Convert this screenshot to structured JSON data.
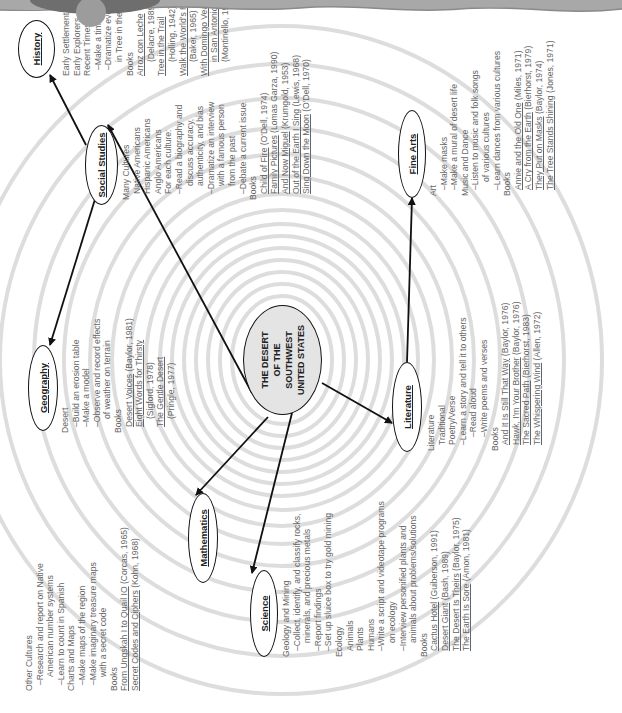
{
  "center": {
    "line1": "THE DESERT",
    "line2": "OF THE SOUTHWEST",
    "line3": "UNITED STATES"
  },
  "nodes": {
    "history": "History",
    "social_studies": "Social Studies",
    "geography": "Geography",
    "mathematics": "Mathematics",
    "science": "Science",
    "literature": "Literature",
    "fine_arts": "Fine Arts"
  },
  "blocks": {
    "other_cultures": [
      {
        "t": "Other Cultures",
        "i": 0,
        "u": false
      },
      {
        "t": "–Research and report on Native",
        "i": 1,
        "u": false
      },
      {
        "t": "American number systems",
        "i": 2,
        "u": false
      },
      {
        "t": "–Learn to count in Spanish",
        "i": 1,
        "u": false
      },
      {
        "t": "Charts and Maps",
        "i": 0,
        "u": false
      },
      {
        "t": "–Make maps of the region",
        "i": 1,
        "u": false
      },
      {
        "t": "–Make imaginary treasure maps",
        "i": 1,
        "u": false
      },
      {
        "t": "with a secret code",
        "i": 2,
        "u": false
      },
      {
        "t": "Books",
        "i": 0,
        "u": false
      },
      {
        "t": "From Ungskah I to Quail IO (Corcas, 1965)",
        "i": 0,
        "u": false
      },
      {
        "t": "Secret Codes and Ciphers (Kohn, 1968)",
        "i": 0,
        "u": false
      }
    ],
    "geography": [
      {
        "t": "Desert",
        "i": 0
      },
      {
        "t": "–Build an erosion table",
        "i": 1
      },
      {
        "t": "–Make a model",
        "i": 1
      },
      {
        "t": "–Observe and record effects",
        "i": 1
      },
      {
        "t": "of weather on terrain",
        "i": 2
      },
      {
        "t": "Books",
        "i": 0
      },
      {
        "t": "Desert Voices (Baylor, 1981)",
        "i": 1
      },
      {
        "t": "Eight Words for Thirsty",
        "i": 1
      },
      {
        "t": "(Sigford, 1978)",
        "i": 2
      },
      {
        "t": "The Gentle Desert",
        "i": 1
      },
      {
        "t": "(Pringle, 1977)",
        "i": 2
      }
    ],
    "social_studies": [
      {
        "t": "Many Cultures",
        "i": 0
      },
      {
        "t": "Native Americans",
        "i": 1
      },
      {
        "t": "Hispanic Americans",
        "i": 1
      },
      {
        "t": "Anglo Americans",
        "i": 1
      },
      {
        "t": "For each culture:",
        "i": 1
      },
      {
        "t": "–Read a biography and",
        "i": 1
      },
      {
        "t": "discuss accuracy,",
        "i": 2
      },
      {
        "t": "authenticity, and bias",
        "i": 2
      },
      {
        "t": "–Dramatize an interview",
        "i": 1
      },
      {
        "t": "with a famous person",
        "i": 2
      },
      {
        "t": "from the past",
        "i": 2
      },
      {
        "t": "–Debate a current issue",
        "i": 1
      },
      {
        "t": "Books",
        "i": 0
      },
      {
        "t": "Child of Fire (O'Dell, 1974)",
        "i": 1
      },
      {
        "t": "Family Pictures (Lomas Garza, 1990)",
        "i": 1
      },
      {
        "t": "And Now Miguel (Krumgold, 1953)",
        "i": 1
      },
      {
        "t": "Out of the Earth I Sing (Lewis, 1968)",
        "i": 1
      },
      {
        "t": "Sing Down the Moon (O'Dell, 1970)",
        "i": 1
      }
    ],
    "history": [
      {
        "t": "Early Settlement",
        "i": 0
      },
      {
        "t": "Early Explorers",
        "i": 0
      },
      {
        "t": "Recent Times",
        "i": 0
      },
      {
        "t": "–Make a timeline",
        "i": 1
      },
      {
        "t": "–Dramatize events",
        "i": 1
      },
      {
        "t": "in Tree in the Trail",
        "i": 2
      },
      {
        "t": "Books",
        "i": 0
      },
      {
        "t": "Arroz con Leche",
        "i": 0
      },
      {
        "t": "(Delacre, 1989)",
        "i": 2
      },
      {
        "t": "Tree in the Trail",
        "i": 0
      },
      {
        "t": "(Holling, 1942)",
        "i": 2
      },
      {
        "t": "Walk the World's Rim",
        "i": 0
      },
      {
        "t": "(Baker, 1965)",
        "i": 2
      },
      {
        "t": "With Domingo Veal",
        "i": 0
      },
      {
        "t": "in San Antonio",
        "i": 2
      },
      {
        "t": "(Montinello, 1980)",
        "i": 2
      }
    ],
    "science": [
      {
        "t": "Geology and Mining",
        "i": 0
      },
      {
        "t": "–Collect, identify, and classify rocks,",
        "i": 1
      },
      {
        "t": "minerals, and precious metals",
        "i": 2
      },
      {
        "t": "–Report findings",
        "i": 1
      },
      {
        "t": "–Set up sluice box to try gold mining",
        "i": 1
      },
      {
        "t": "Ecology",
        "i": 0
      },
      {
        "t": "Animals",
        "i": 1
      },
      {
        "t": "Plants",
        "i": 1
      },
      {
        "t": "Humans",
        "i": 1
      },
      {
        "t": "–Write a script and videotape programs",
        "i": 1
      },
      {
        "t": "on ecology",
        "i": 2
      },
      {
        "t": "–Interview personified plants and",
        "i": 1
      },
      {
        "t": "animals about problems/solutions",
        "i": 2
      },
      {
        "t": "Books",
        "i": 0
      },
      {
        "t": "Cactus Hotel (Guiberson, 1991)",
        "i": 1
      },
      {
        "t": "Desert Giant (Bash, 1989)",
        "i": 1
      },
      {
        "t": "The Desert Is Theirs (Baylor, 1975)",
        "i": 1
      },
      {
        "t": "The Earth Is Sore (Amon, 1981)",
        "i": 1
      }
    ],
    "literature": [
      {
        "t": "Literature",
        "i": 0
      },
      {
        "t": "Traditional",
        "i": 1
      },
      {
        "t": "Poetry/Verse",
        "i": 1
      },
      {
        "t": "–Learn a story and tell it to others",
        "i": 1
      },
      {
        "t": "–Read aloud",
        "i": 2
      },
      {
        "t": "–Write poems and verses",
        "i": 2
      },
      {
        "t": "Books",
        "i": 0
      },
      {
        "t": "And It Is Still That Way (Baylor, 1976)",
        "i": 1
      },
      {
        "t": "Hawk, I'm Your Brother (Baylor, 1976)",
        "i": 1
      },
      {
        "t": "The Sacred Path (Bierhorst, 1983)",
        "i": 1
      },
      {
        "t": "The Whispering Wind (Allen, 1972)",
        "i": 1
      }
    ],
    "fine_arts": [
      {
        "t": "Art",
        "i": 0
      },
      {
        "t": "–Make masks",
        "i": 1
      },
      {
        "t": "–Make a mural of desert life",
        "i": 1
      },
      {
        "t": "Music and Dance",
        "i": 0
      },
      {
        "t": "–Listen to music and folk songs",
        "i": 1
      },
      {
        "t": "of various cultures",
        "i": 2
      },
      {
        "t": "–Learn dances from various cultures",
        "i": 1
      },
      {
        "t": "Books",
        "i": 0
      },
      {
        "t": "Annie and the Old One (Miles, 1971)",
        "i": 1
      },
      {
        "t": "A Cry from the Earth (Bierhorst, 1979)",
        "i": 1
      },
      {
        "t": "They Put on Masks (Baylor, 1974)",
        "i": 1
      },
      {
        "t": "The Tree Stands Shining (Jones, 1971)",
        "i": 1
      }
    ]
  },
  "underlined": [
    "From Ungskah I to Quail IO",
    "Secret Codes and Ciphers",
    "Desert Voices",
    "Eight Words for Thirsty",
    "The Gentle Desert",
    "Child of Fire",
    "Family Pictures",
    "And Now Miguel",
    "Out of the Earth I Sing",
    "Sing Down the Moon",
    "Arroz con Leche",
    "Tree in the Trail",
    "Walk the World's Rim",
    "With Domingo Veal",
    "in San Antonio",
    "Cactus Hotel",
    "Desert Giant",
    "The Desert Is Theirs",
    "The Earth Is Sore",
    "And It Is Still That Way",
    "Hawk, I'm Your Brother",
    "The Sacred Path",
    "The Whispering Wind",
    "Annie and the Old One",
    "A Cry from the Earth",
    "They Put on Masks",
    "The Tree Stands Shining"
  ],
  "colors": {
    "text": "#666666",
    "rings": "#dddddd",
    "center_fill": "#e4e4e4",
    "header": "#9a9a9a"
  }
}
